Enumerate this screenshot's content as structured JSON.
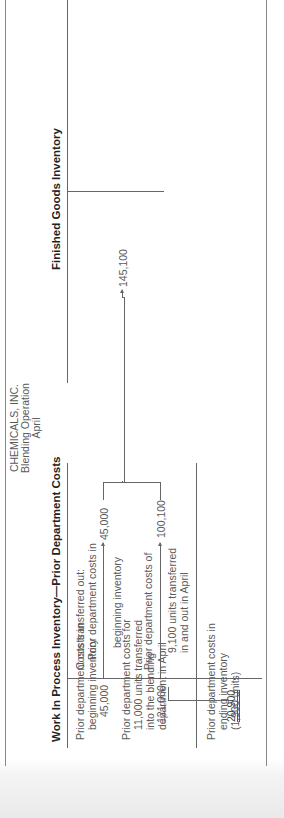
{
  "company": {
    "name": "CHEMICALS, INC.",
    "operation": "Blending Operation",
    "period": "April"
  },
  "wip_account": {
    "title": "Work In Process Inventory—Prior Department Costs",
    "debits": [
      {
        "label_lines": [
          "Prior department costs in",
          "beginning inventory"
        ],
        "amount": "45,000"
      },
      {
        "label_lines": [
          "Prior department costs for",
          "11,000 units transferred",
          "into the blending",
          "department in April"
        ],
        "amount": "121,000"
      }
    ],
    "credits_heading": "Costs transferred out:",
    "credits": [
      {
        "label_lines": [
          "Prior department costs in",
          "beginning inventory"
        ],
        "amount": "45,000"
      },
      {
        "label_lines": [
          "Prior department costs of",
          "9,100 units transferred",
          "in and out in April"
        ],
        "amount": "100,100"
      }
    ],
    "ending_balance": {
      "label_lines": [
        "Prior department costs in",
        "ending inventory",
        "(1,900 units)"
      ],
      "amount": "20,900"
    }
  },
  "finished_goods_account": {
    "title": "Finished Goods Inventory",
    "debit_amount": "145,100"
  },
  "colors": {
    "rule": "#666666",
    "text": "#5a5a5a",
    "heading": "#222222",
    "bottom_band": "#e9e9e9"
  }
}
